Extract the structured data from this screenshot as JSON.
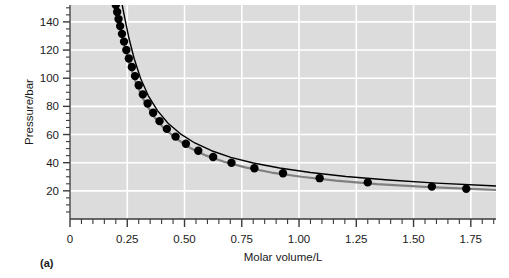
{
  "figure": {
    "panel_label": "(a)"
  },
  "chart_data": {
    "type": "scatter",
    "title": "",
    "xlabel": "Molar volume/L",
    "ylabel": "Pressure/bar",
    "xlim": [
      0,
      1.86
    ],
    "ylim": [
      0,
      152
    ],
    "grid": true,
    "grid_color": "#ffffff",
    "plot_bg": "#dcdcdc",
    "legend": "none",
    "x_major_ticks": [
      0,
      0.25,
      0.5,
      0.75,
      1.0,
      1.25,
      1.5,
      1.75
    ],
    "x_tick_labels": [
      "0",
      "0.25",
      "0.50",
      "0.75",
      "1.00",
      "1.25",
      "1.50",
      "1.75"
    ],
    "x_minor_step": 0.05,
    "y_major_ticks": [
      20,
      40,
      60,
      80,
      100,
      120,
      140
    ],
    "y_tick_labels": [
      "20",
      "40",
      "60",
      "80",
      "100",
      "120",
      "140"
    ],
    "y_minor_step": 5,
    "series": [
      {
        "name": "experimental points",
        "type": "scatter",
        "marker": "filled-circle",
        "color": "#000000",
        "marker_size": 4.2,
        "x": [
          0.2,
          0.206,
          0.212,
          0.219,
          0.227,
          0.236,
          0.246,
          0.257,
          0.27,
          0.284,
          0.3,
          0.318,
          0.339,
          0.363,
          0.391,
          0.423,
          0.461,
          0.506,
          0.56,
          0.625,
          0.705,
          0.805,
          0.93,
          1.09,
          1.3,
          1.58,
          1.73
        ],
        "y": [
          152.0,
          147.0,
          142.0,
          137.0,
          131.5,
          126.0,
          120.0,
          114.0,
          108.0,
          101.5,
          95.0,
          88.5,
          82.0,
          75.5,
          69.5,
          64.0,
          58.5,
          53.5,
          48.5,
          44.0,
          40.0,
          36.0,
          32.5,
          29.0,
          26.0,
          23.0,
          21.5
        ]
      },
      {
        "name": "fitted curve through data",
        "type": "line",
        "color": "#808080",
        "width": 2.2,
        "x": [
          0.2,
          0.215,
          0.235,
          0.26,
          0.29,
          0.325,
          0.365,
          0.41,
          0.465,
          0.525,
          0.595,
          0.675,
          0.77,
          0.88,
          1.01,
          1.16,
          1.34,
          1.55,
          1.8,
          1.86
        ],
        "y": [
          152.0,
          139.0,
          124.5,
          110.0,
          96.0,
          83.5,
          73.0,
          64.5,
          57.0,
          50.5,
          45.0,
          40.5,
          36.5,
          33.0,
          30.0,
          27.2,
          24.8,
          22.8,
          21.0,
          20.6
        ]
      },
      {
        "name": "model isotherm",
        "type": "line",
        "color": "#000000",
        "width": 1.4,
        "x": [
          0.228,
          0.24,
          0.258,
          0.28,
          0.308,
          0.342,
          0.382,
          0.428,
          0.482,
          0.545,
          0.618,
          0.702,
          0.8,
          0.915,
          1.05,
          1.205,
          1.39,
          1.6,
          1.84,
          1.86
        ],
        "y": [
          152.0,
          142.0,
          128.0,
          114.0,
          100.0,
          87.5,
          77.0,
          68.0,
          60.5,
          54.0,
          48.5,
          43.8,
          39.8,
          36.2,
          33.0,
          30.2,
          27.7,
          25.5,
          23.6,
          23.4
        ]
      }
    ]
  }
}
